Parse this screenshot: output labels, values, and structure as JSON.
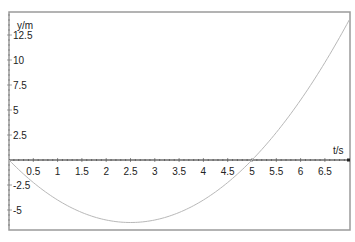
{
  "chart_data": {
    "type": "line",
    "title": "",
    "xlabel": "t/s",
    "ylabel": "y/m",
    "xlim": [
      0,
      7
    ],
    "ylim": [
      -7,
      14.8
    ],
    "grid": false,
    "legend": null,
    "x_ticks": [
      "0.5",
      "1",
      "1.5",
      "2",
      "2.5",
      "3",
      "3.5",
      "4",
      "4.5",
      "5",
      "5.5",
      "6",
      "6.5"
    ],
    "y_ticks": [
      "12.5",
      "10",
      "7.5",
      "5",
      "2.5",
      "-2.5",
      "-5"
    ],
    "series": [
      {
        "name": "y(t)",
        "color": "#b8b8b8",
        "x": [
          0,
          0.5,
          1,
          1.5,
          2,
          2.5,
          3,
          3.5,
          4,
          4.5,
          5,
          5.5,
          6,
          6.5,
          7
        ],
        "values": [
          0,
          -2.25,
          -4,
          -5.25,
          -6,
          -6.25,
          -6,
          -5.25,
          -4,
          -2.25,
          0,
          2.75,
          6,
          9.75,
          14
        ]
      }
    ]
  },
  "colors": {
    "frame": "#9a9a9a",
    "axis": "#222222",
    "curve": "#b8b8b8"
  }
}
